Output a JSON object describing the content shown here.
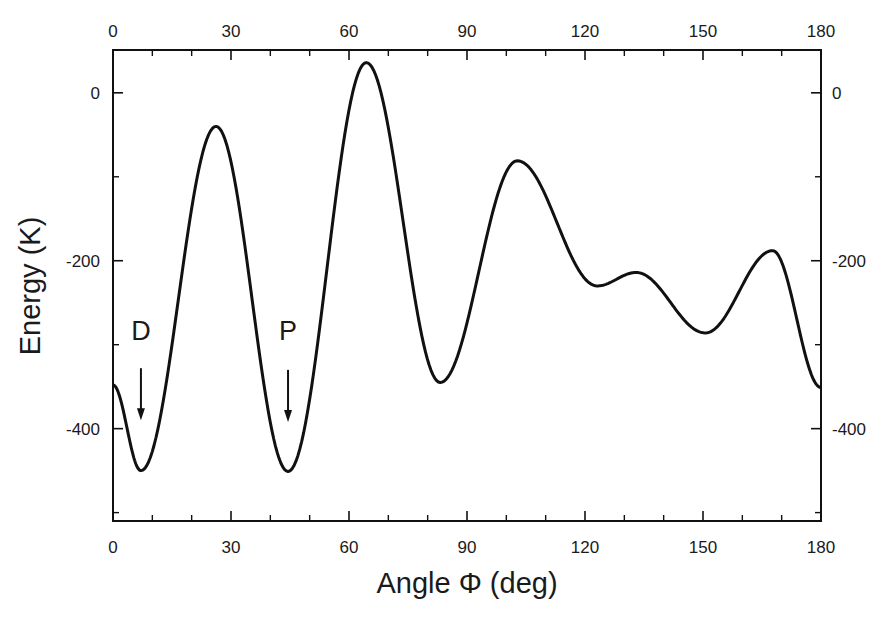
{
  "chart_data": {
    "type": "line",
    "title": "",
    "xlabel": "Angle Φ  (deg)",
    "ylabel": "Energy  (K)",
    "xlim": [
      0,
      180
    ],
    "ylim": [
      -510,
      51
    ],
    "grid": false,
    "legend": null,
    "x_ticks": [
      0,
      30,
      60,
      90,
      120,
      150,
      180
    ],
    "x_tick_labels": [
      "0",
      "30",
      "60",
      "90",
      "120",
      "150",
      "180"
    ],
    "x_minor_ticks": [
      10,
      20,
      40,
      50,
      70,
      80,
      100,
      110,
      130,
      140,
      160,
      170
    ],
    "y_ticks": [
      0,
      -200,
      -400
    ],
    "y_tick_labels": [
      "0",
      "-200",
      "-400"
    ],
    "y_minor_ticks": [
      -100,
      -300,
      -500
    ],
    "mirror_axes": true,
    "series": [
      {
        "name": "Energy",
        "color": "#111111",
        "x": [
          0,
          7.1,
          26.2,
          44.5,
          64.4,
          83.2,
          102.8,
          123.1,
          133.0,
          150.6,
          167.7,
          180
        ],
        "y": [
          -348,
          -450,
          -40,
          -451,
          36,
          -345,
          -81,
          -230,
          -214,
          -286,
          -188,
          -351
        ]
      }
    ],
    "annotations": [
      {
        "text": "D",
        "x": 7.1,
        "label_y": -295,
        "arrow_from": -328,
        "arrow_to": -390
      },
      {
        "text": "P",
        "x": 44.5,
        "label_y": -295,
        "arrow_from": -330,
        "arrow_to": -392
      }
    ]
  }
}
